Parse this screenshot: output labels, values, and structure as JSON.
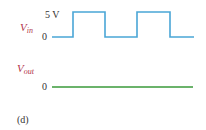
{
  "figure": {
    "caption": "(d)",
    "vin": {
      "symbol": "V",
      "subscript": "in",
      "high_label": "5 V",
      "low_label": "0",
      "color": "#4aa6d6",
      "description": "square wave pulses between 0 and 5 V"
    },
    "vout": {
      "symbol": "V",
      "subscript": "out",
      "low_label": "0",
      "color": "#3a9a3a",
      "description": "flat line at 0 V"
    }
  },
  "colors": {
    "label_signal": "#b2334a",
    "label_text": "#333333",
    "vin_trace": "#4aa6d6",
    "vout_trace": "#3a9a3a"
  }
}
